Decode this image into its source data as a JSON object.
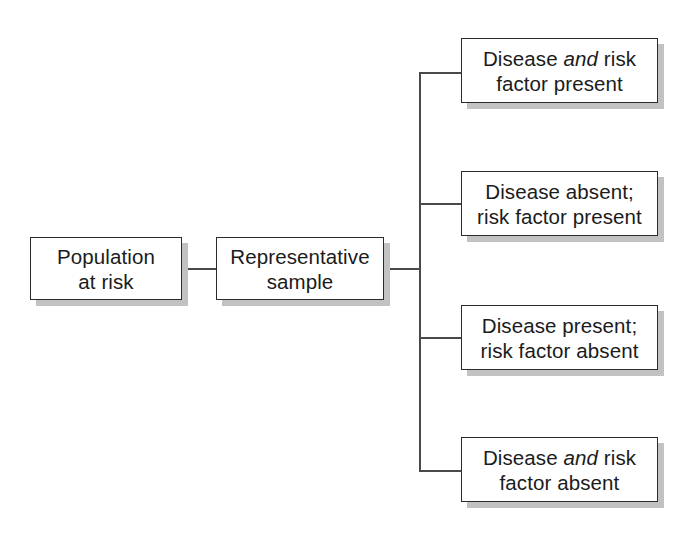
{
  "diagram": {
    "type": "flowchart",
    "background_color": "#ffffff",
    "box_border_color": "#2b2b2b",
    "box_fill_color": "#ffffff",
    "box_shadow_color": "#c2c2c2",
    "connector_color": "#4a4a4a",
    "nodes": {
      "population": {
        "label": "Population\nat risk"
      },
      "sample": {
        "label": "Representative\nsample"
      },
      "outcome_1": {
        "line1_before": "Disease ",
        "line1_italic": "and",
        "line1_after": " risk",
        "line2": "factor present",
        "plain": "Disease and risk factor present"
      },
      "outcome_2": {
        "line1": "Disease absent;",
        "line2": "risk factor present",
        "plain": "Disease absent; risk factor present"
      },
      "outcome_3": {
        "line1": "Disease present;",
        "line2": "risk factor absent",
        "plain": "Disease present; risk factor absent"
      },
      "outcome_4": {
        "line1_before": "Disease ",
        "line1_italic": "and",
        "line1_after": " risk",
        "line2": "factor absent",
        "plain": "Disease and risk factor absent"
      }
    }
  }
}
